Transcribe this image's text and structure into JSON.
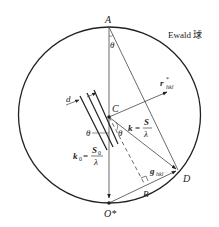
{
  "title": "Ewald 球",
  "points": {
    "A": "A",
    "C": "C",
    "D": "D",
    "B": "B",
    "O": "O*"
  },
  "angles": {
    "theta_top": "θ",
    "theta_left": "θ",
    "theta_right": "θ"
  },
  "vectors": {
    "r_main": "r",
    "r_star": "*",
    "r_sub": "hkl",
    "g_main": "g",
    "g_sub": "hkl",
    "k_main": "k",
    "k_eq": "=",
    "k_num": "S",
    "k_den": "λ",
    "k0_main": "k",
    "k0_sub": "0",
    "k0_eq": "=",
    "k0_num": "S",
    "k0_num_sub": "0",
    "k0_den": "λ"
  },
  "spacing_label": "d",
  "colors": {
    "line": "#222222",
    "thin": "#444444"
  }
}
